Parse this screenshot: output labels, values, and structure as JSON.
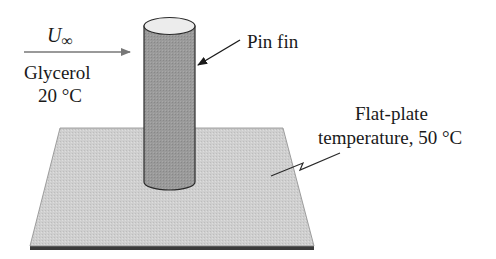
{
  "diagram": {
    "flow": {
      "velocity_symbol": "U",
      "velocity_subscript": "∞",
      "fluid": "Glycerol",
      "fluid_temperature": "20 °C"
    },
    "fin": {
      "label": "Pin fin"
    },
    "plate": {
      "label_line1": "Flat-plate",
      "label_line2": "temperature, 50 °C"
    },
    "colors": {
      "plate_surface": "#cfcfcf",
      "plate_edge": "#3a3a3a",
      "fin_body": "#9a9a9a",
      "fin_top": "#ececec",
      "outline": "#2a2a2a",
      "flow_arrow": "#777777"
    }
  }
}
